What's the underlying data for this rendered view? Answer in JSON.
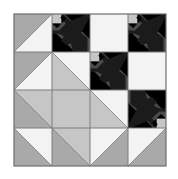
{
  "quilt": {
    "title": "Maple leaf quilt block",
    "grid": {
      "rows": 4,
      "cols": 4,
      "origin_x": 14,
      "origin_y": 14,
      "cell_size": 38
    },
    "colors": {
      "white": "#f3f3f3",
      "light_gray": "#c6c6c6",
      "gray": "#a9a9a9",
      "dark_gray": "#4b4b4b",
      "black": "#1b1b1b",
      "seam": "#7c7c7c",
      "border": "#6e6e6e"
    },
    "cells": [
      {
        "row": 0,
        "col": 0,
        "type": "hst",
        "diagonal": "bl-tr",
        "first": "gray",
        "second": "white"
      },
      {
        "row": 0,
        "col": 1,
        "type": "leaf",
        "orientation": "down-left",
        "corner": "light_gray",
        "bg": "gray",
        "base": "light_gray",
        "base2": "dark_gray"
      },
      {
        "row": 0,
        "col": 2,
        "type": "solid",
        "fill": "white"
      },
      {
        "row": 0,
        "col": 3,
        "type": "leaf",
        "orientation": "down-left",
        "corner": "light_gray",
        "bg": "gray",
        "base": "dark_gray",
        "base2": "dark_gray"
      },
      {
        "row": 1,
        "col": 0,
        "type": "hst",
        "diagonal": "bl-tr",
        "first": "gray",
        "second": "white"
      },
      {
        "row": 1,
        "col": 1,
        "type": "hst",
        "diagonal": "tl-br",
        "first": "white",
        "second": "light_gray"
      },
      {
        "row": 1,
        "col": 2,
        "type": "leaf",
        "orientation": "down-left",
        "corner": "light_gray",
        "bg": "gray",
        "base": "dark_gray",
        "base2": "dark_gray"
      },
      {
        "row": 1,
        "col": 3,
        "type": "solid",
        "fill": "white"
      },
      {
        "row": 2,
        "col": 0,
        "type": "hst",
        "diagonal": "tl-br",
        "first": "light_gray",
        "second": "gray"
      },
      {
        "row": 2,
        "col": 1,
        "type": "solid",
        "fill": "light_gray"
      },
      {
        "row": 2,
        "col": 2,
        "type": "hst",
        "diagonal": "tl-br",
        "first": "white",
        "second": "light_gray"
      },
      {
        "row": 2,
        "col": 3,
        "type": "leaf",
        "orientation": "up-right",
        "corner": "light_gray",
        "bg": "gray",
        "base": "dark_gray",
        "base2": "dark_gray"
      },
      {
        "row": 3,
        "col": 0,
        "type": "hst",
        "diagonal": "tl-br",
        "first": "white",
        "second": "gray"
      },
      {
        "row": 3,
        "col": 1,
        "type": "hst",
        "diagonal": "tl-br",
        "first": "light_gray",
        "second": "gray"
      },
      {
        "row": 3,
        "col": 2,
        "type": "hst",
        "diagonal": "bl-tr",
        "first": "white",
        "second": "gray"
      },
      {
        "row": 3,
        "col": 3,
        "type": "hst",
        "diagonal": "bl-tr",
        "first": "white",
        "second": "gray"
      }
    ]
  }
}
